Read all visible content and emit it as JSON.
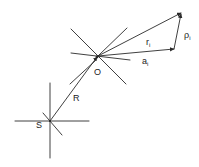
{
  "diagram": {
    "type": "vector-geometry",
    "points": {
      "O": {
        "label": "O",
        "x": 98,
        "y": 56
      },
      "S": {
        "label": "S",
        "x": 50,
        "y": 121
      },
      "apex": {
        "x": 181,
        "y": 13
      },
      "a_end": {
        "x": 174,
        "y": 49
      }
    },
    "labels": {
      "O": "O",
      "S": "S",
      "R": "R",
      "r": "r",
      "r_sub": "i",
      "a": "a",
      "a_sub": "i",
      "rho": "ρ",
      "rho_sub": "i"
    },
    "vectors": [
      {
        "name": "R",
        "from": "S",
        "to": "O"
      },
      {
        "name": "r_i",
        "from": "O",
        "to": "apex"
      },
      {
        "name": "a_i",
        "from": "O",
        "to": "a_end"
      },
      {
        "name": "rho_i",
        "from": "a_end",
        "to": "apex"
      }
    ],
    "colors": {
      "stroke": "#2a2a2a",
      "background": "#ffffff"
    }
  }
}
